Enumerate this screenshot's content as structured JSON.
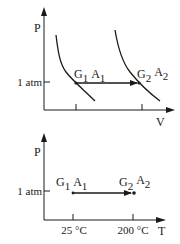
{
  "top_plot": {
    "y_axis_label": "P",
    "x_axis_label": "V",
    "pressure_tick_label": "1 atm",
    "state1": {
      "G": "G",
      "G_sub": "1",
      "A": "A",
      "A_sub": "1"
    },
    "state2": {
      "G": "G",
      "G_sub": "2",
      "A": "A",
      "A_sub": "2"
    }
  },
  "bottom_plot": {
    "y_axis_label": "P",
    "x_axis_label": "T",
    "pressure_tick_label": "1 atm",
    "x_tick_labels": [
      "25 °C",
      "200 °C"
    ],
    "state1": {
      "G": "G",
      "G_sub": "1",
      "A": "A",
      "A_sub": "1"
    },
    "state2": {
      "G": "G",
      "G_sub": "2",
      "A": "A",
      "A_sub": "2"
    }
  },
  "colors": {
    "ink": "#1a1a1a",
    "background": "#ffffff"
  }
}
